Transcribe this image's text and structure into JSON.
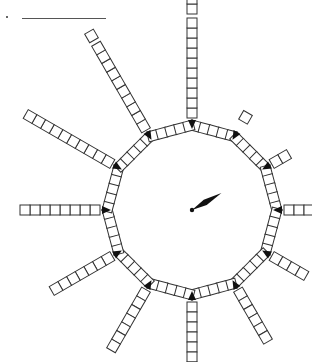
{
  "question": {
    "bullet": "·",
    "answer_blank": ""
  },
  "figure": {
    "center": [
      192,
      210
    ],
    "ring": {
      "sides": 12,
      "squares_per_side": 5,
      "vertex_radius": 90,
      "square_size": 10,
      "marker": "black-triangle-at-each-vertex"
    },
    "spokes": [
      {
        "hour": 1,
        "squares": 1,
        "gap_after": 0,
        "first_offset": 10
      },
      {
        "hour": 2,
        "squares": 2,
        "gap_after": 0,
        "first_offset": 0
      },
      {
        "hour": 3,
        "squares": 3,
        "gap_after": 0,
        "first_offset": 0
      },
      {
        "hour": 4,
        "squares": 4,
        "gap_after": 0,
        "first_offset": 0
      },
      {
        "hour": 5,
        "squares": 6,
        "gap_after": 0,
        "first_offset": 0
      },
      {
        "hour": 6,
        "squares": 7,
        "gap_after": 0,
        "first_offset": 0
      },
      {
        "hour": 7,
        "squares": 7,
        "gap_after": 0,
        "first_offset": 0
      },
      {
        "hour": 8,
        "squares": 7,
        "gap_after": 0,
        "first_offset": 0
      },
      {
        "hour": 9,
        "squares": 8,
        "gap_after": 0,
        "first_offset": 0
      },
      {
        "hour": 10,
        "squares": 10,
        "gap_after": 0,
        "first_offset": 0
      },
      {
        "hour": 11,
        "squares": 11,
        "gap_after": 10,
        "first_offset": 0
      },
      {
        "hour": 12,
        "squares": 12,
        "gap_after": 10,
        "first_offset": 0
      }
    ],
    "hand": {
      "angle_deg_from_12": 60,
      "length": 34,
      "color": "#111111"
    },
    "colors": {
      "stroke": "#333333",
      "fill": "#ffffff",
      "marker": "#111111"
    }
  }
}
